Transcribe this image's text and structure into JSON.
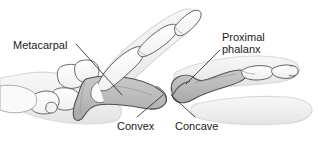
{
  "figure": {
    "background_color": "#ffffff",
    "line_color": "#4a4a4a",
    "bone_fill_white": "#fdfdfd",
    "bone_fill_shaded": "#b9b9b9",
    "soft_tissue_fill": "#f2f2f2",
    "soft_tissue_stroke": "#dcdcdc",
    "text_color": "#1a1a1a"
  },
  "labels": {
    "metacarpal": "Metacarpal",
    "proximal_line1": "Proximal",
    "proximal_line2": "phalanx",
    "convex": "Convex",
    "concave": "Concave"
  },
  "anatomy": {
    "shaded_bones": [
      "Metacarpal",
      "Proximal phalanx"
    ],
    "unshaded_bones": [
      "Carpals",
      "Middle phalanx",
      "Distal phalanx"
    ],
    "joint": "Metacarpophalangeal (MCP) joint",
    "convex_surface": "Metacarpal head",
    "concave_surface": "Proximal phalanx base"
  },
  "leader_lines": [
    {
      "name": "metacarpal-leader",
      "from_x": 76,
      "from_y": 44,
      "to_x": 122,
      "to_y": 95
    },
    {
      "name": "proximal-phalanx-leader",
      "from_x": 220,
      "from_y": 50,
      "to_x": 186,
      "to_y": 84
    },
    {
      "name": "convex-leader",
      "from_x": 137,
      "from_y": 117,
      "to_x": 163,
      "to_y": 95
    },
    {
      "name": "concave-leader",
      "from_x": 195,
      "from_y": 117,
      "to_x": 171,
      "to_y": 95
    }
  ]
}
